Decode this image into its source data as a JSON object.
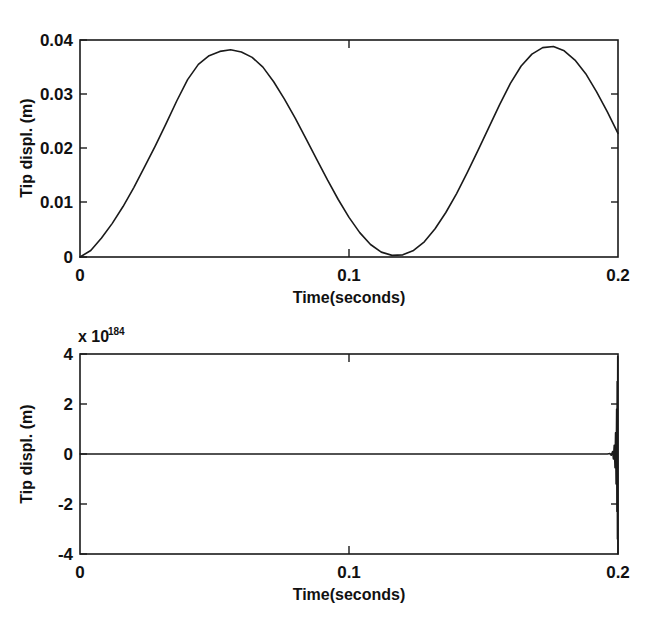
{
  "figure": {
    "background_color": "#ffffff",
    "line_color": "#1a1a1a",
    "panel_count": 2
  },
  "chart_data": [
    {
      "type": "line",
      "panel": "top",
      "title": "",
      "xlabel": "Time(seconds)",
      "ylabel": "Tip displ. (m)",
      "xlim": [
        0,
        0.2
      ],
      "ylim": [
        0,
        0.04
      ],
      "xticks": [
        0,
        0.1,
        0.2
      ],
      "xticklabels": [
        "0",
        "0.1",
        "0.2"
      ],
      "yticks": [
        0,
        0.01,
        0.02,
        0.03,
        0.04
      ],
      "yticklabels": [
        "0",
        "0.01",
        "0.02",
        "0.03",
        "0.04"
      ],
      "grid": false,
      "legend": null,
      "exponent_label": "",
      "series": [
        {
          "name": "tip displacement (stable)",
          "x": [
            0.0,
            0.004,
            0.008,
            0.012,
            0.016,
            0.02,
            0.024,
            0.028,
            0.032,
            0.036,
            0.04,
            0.044,
            0.048,
            0.052,
            0.056,
            0.06,
            0.064,
            0.068,
            0.072,
            0.076,
            0.08,
            0.084,
            0.088,
            0.092,
            0.096,
            0.1,
            0.104,
            0.108,
            0.112,
            0.116,
            0.12,
            0.124,
            0.128,
            0.132,
            0.136,
            0.14,
            0.144,
            0.148,
            0.152,
            0.156,
            0.16,
            0.164,
            0.168,
            0.172,
            0.176,
            0.18,
            0.184,
            0.188,
            0.192,
            0.196,
            0.2
          ],
          "y": [
            0.0,
            0.0012,
            0.0035,
            0.0062,
            0.0093,
            0.0128,
            0.0166,
            0.0205,
            0.0246,
            0.0288,
            0.0327,
            0.0355,
            0.0371,
            0.0379,
            0.0382,
            0.0378,
            0.0368,
            0.035,
            0.0323,
            0.0291,
            0.0256,
            0.0218,
            0.018,
            0.0142,
            0.0106,
            0.0073,
            0.0045,
            0.0023,
            0.0009,
            0.0003,
            0.0004,
            0.0012,
            0.0028,
            0.0052,
            0.0082,
            0.0117,
            0.0156,
            0.0197,
            0.0239,
            0.0281,
            0.032,
            0.0352,
            0.0374,
            0.0386,
            0.0388,
            0.038,
            0.0363,
            0.0338,
            0.0305,
            0.0268,
            0.0228
          ]
        }
      ]
    },
    {
      "type": "line",
      "panel": "bottom",
      "title": "",
      "xlabel": "Time(seconds)",
      "ylabel": "Tip displ. (m)",
      "xlim": [
        0,
        0.2
      ],
      "ylim": [
        -4,
        4
      ],
      "xticks": [
        0,
        0.1,
        0.2
      ],
      "xticklabels": [
        "0",
        "0.1",
        "0.2"
      ],
      "yticks": [
        -4,
        -2,
        0,
        2,
        4
      ],
      "yticklabels": [
        "-4",
        "-2",
        "0",
        "2",
        "4"
      ],
      "grid": false,
      "legend": null,
      "exponent_label": "x 10",
      "exponent_value": "184",
      "description": "Unstable response: flat at zero until t~0.197 then diverging oscillation reaching +/-4e184 at t=0.2",
      "series": [
        {
          "name": "tip displacement (unstable)",
          "x": [
            0.0,
            0.05,
            0.1,
            0.15,
            0.18,
            0.19,
            0.194,
            0.196,
            0.197,
            0.1975,
            0.198,
            0.1983,
            0.1986,
            0.1989,
            0.1991,
            0.1993,
            0.1995,
            0.1996,
            0.1997,
            0.1998,
            0.1999,
            0.2
          ],
          "y": [
            0.0,
            0.0,
            0.0,
            0.0,
            0.0,
            0.0,
            0.0,
            0.0,
            0.02,
            -0.05,
            0.1,
            -0.2,
            0.35,
            -0.55,
            0.85,
            -1.2,
            1.8,
            -2.3,
            2.9,
            -3.4,
            3.9,
            -4.0
          ]
        }
      ]
    }
  ]
}
